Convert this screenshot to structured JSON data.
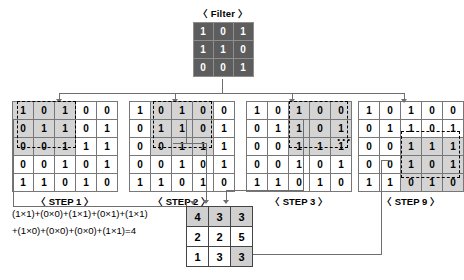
{
  "filter": {
    "title": "〈 Filter 〉",
    "rows": [
      [
        1,
        0,
        1
      ],
      [
        1,
        1,
        0
      ],
      [
        0,
        0,
        1
      ]
    ]
  },
  "input_matrix": {
    "rows": [
      [
        1,
        0,
        1,
        0,
        0
      ],
      [
        0,
        1,
        1,
        0,
        1
      ],
      [
        0,
        0,
        1,
        1,
        1
      ],
      [
        0,
        0,
        1,
        0,
        1
      ],
      [
        1,
        1,
        0,
        1,
        0
      ]
    ]
  },
  "steps": [
    {
      "label": "〈 STEP 1 〉",
      "window_row": 0,
      "window_col": 0,
      "rows": [
        [
          1,
          0,
          1,
          0,
          0
        ],
        [
          0,
          1,
          1,
          0,
          1
        ],
        [
          0,
          0,
          1,
          1,
          1
        ],
        [
          0,
          0,
          1,
          0,
          1
        ],
        [
          1,
          1,
          0,
          1,
          0
        ]
      ]
    },
    {
      "label": "〈 STEP 2 〉",
      "window_row": 0,
      "window_col": 1,
      "rows": [
        [
          1,
          0,
          1,
          0,
          0
        ],
        [
          0,
          1,
          1,
          0,
          1
        ],
        [
          0,
          0,
          1,
          1,
          1
        ],
        [
          0,
          0,
          1,
          0,
          1
        ],
        [
          1,
          1,
          0,
          1,
          0
        ]
      ]
    },
    {
      "label": "〈 STEP 3 〉",
      "window_row": 0,
      "window_col": 2,
      "rows": [
        [
          1,
          0,
          1,
          0,
          0
        ],
        [
          0,
          1,
          1,
          0,
          1
        ],
        [
          0,
          0,
          1,
          1,
          1
        ],
        [
          0,
          0,
          1,
          0,
          1
        ],
        [
          1,
          1,
          0,
          1,
          0
        ]
      ]
    },
    {
      "label": "〈 STEP 9 〉",
      "window_row": 2,
      "window_col": 2,
      "rows": [
        [
          1,
          0,
          1,
          0,
          0
        ],
        [
          0,
          1,
          1,
          0,
          1
        ],
        [
          0,
          0,
          1,
          1,
          1
        ],
        [
          0,
          0,
          1,
          0,
          1
        ],
        [
          1,
          1,
          0,
          1,
          0
        ]
      ]
    }
  ],
  "ellipsis": "···",
  "formula": {
    "line1": "(1×1)+(0×0)+(1×1)+(0×1)+(1×1)",
    "line2": "+(1×0)+(0×0)+(0×0)+(1×1)=4"
  },
  "output_matrix": {
    "rows": [
      [
        4,
        3,
        3
      ],
      [
        2,
        2,
        5
      ],
      [
        1,
        3,
        3
      ]
    ],
    "highlighted": [
      [
        true,
        true,
        true
      ],
      [
        false,
        false,
        false
      ],
      [
        false,
        false,
        true
      ]
    ]
  },
  "colors": {
    "filter_bg": "#5d5d5d",
    "filter_text": "#ffffff",
    "highlight": "#d4d4d4",
    "line": "#6f6f6f",
    "text": "#000000"
  }
}
